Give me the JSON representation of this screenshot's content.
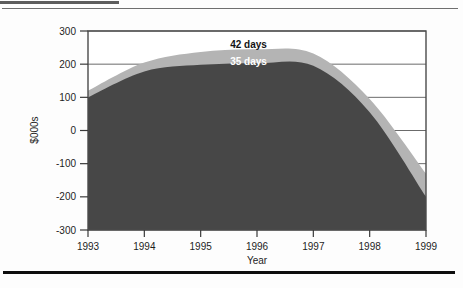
{
  "page": {
    "rules": {
      "top_short": "horizontal-rule-short",
      "top_thin": "horizontal-rule-thin",
      "bottom_thick": "horizontal-rule-thick"
    }
  },
  "chart_data": {
    "type": "area",
    "title": "",
    "xlabel": "Year",
    "ylabel": "$000s",
    "x": [
      1993,
      1994,
      1995,
      1996,
      1997,
      1998,
      1999
    ],
    "categories": [
      "1993",
      "1994",
      "1995",
      "1996",
      "1997",
      "1998",
      "1999"
    ],
    "xtick_labels": [
      "1993",
      "1994",
      "1995",
      "1996",
      "1997",
      "1998",
      "1999"
    ],
    "ytick_labels": [
      "300",
      "200",
      "100",
      "0",
      "-100",
      "-200",
      "-300"
    ],
    "yticks": [
      300,
      200,
      100,
      0,
      -100,
      -200,
      -300
    ],
    "ylim": [
      -300,
      300
    ],
    "xlim": [
      1993,
      1999
    ],
    "grid": "horizontal",
    "legend": "inline-annotations",
    "series": [
      {
        "name": "42 days",
        "color": "#b4b4b4",
        "values": [
          120,
          205,
          237,
          245,
          232,
          95,
          -130
        ]
      },
      {
        "name": "35 days",
        "color": "#474747",
        "values": [
          100,
          178,
          198,
          203,
          195,
          55,
          -200
        ]
      }
    ],
    "annotations": [
      {
        "text": "42 days",
        "x": 1995.85,
        "y": 248,
        "style": "dark-on-light"
      },
      {
        "text": "35 days",
        "x": 1995.85,
        "y": 197,
        "style": "light-on-dark"
      }
    ]
  }
}
